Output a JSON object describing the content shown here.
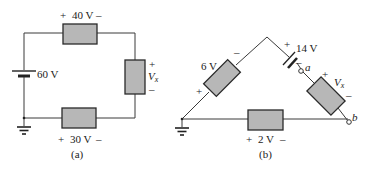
{
  "figure_a": {
    "caption": "(a)",
    "source_label": "60 V",
    "top_resistor": {
      "plus": "+",
      "value": "40 V",
      "minus": "–"
    },
    "right_resistor": {
      "plus": "+",
      "symbol": "V",
      "subscript": "x",
      "minus": "–"
    },
    "bottom_resistor": {
      "plus": "+",
      "value": "30 V",
      "minus": "–"
    },
    "ground": "ground-icon"
  },
  "figure_b": {
    "caption": "(b)",
    "left_resistor": {
      "value": "6 V",
      "plus": "+",
      "minus": "–"
    },
    "battery": {
      "plus": "+",
      "value": "14 V",
      "minus": "–"
    },
    "node_a": "a",
    "node_b": "b",
    "right_resistor": {
      "plus": "+",
      "symbol": "V",
      "subscript": "x",
      "minus": "–"
    },
    "bottom_resistor": {
      "plus": "+",
      "value": "2 V",
      "minus": "–"
    },
    "ground": "ground-icon"
  }
}
